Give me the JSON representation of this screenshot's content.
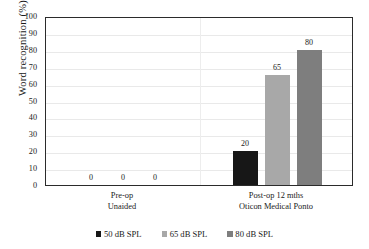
{
  "chart_data": {
    "type": "bar",
    "title": "",
    "xlabel": "",
    "ylabel": "Word recognition (%)",
    "ylim": [
      0,
      100
    ],
    "ytick_step": 10,
    "yticks": [
      "100",
      "90",
      "80",
      "70",
      "60",
      "50",
      "40",
      "30",
      "20",
      "10",
      "0"
    ],
    "grid": "horizontal",
    "legend_position": "bottom",
    "categories": [
      "Pre-op\nUnaided",
      "Post-op 12 mths\nOticon Medical Ponto"
    ],
    "category_lines": [
      [
        "Pre-op",
        "Unaided"
      ],
      [
        "Post-op 12 mths",
        "Oticon Medical Ponto"
      ]
    ],
    "series": [
      {
        "name": "50 dB SPL",
        "color": "#171717",
        "values": [
          0,
          20
        ]
      },
      {
        "name": "65 dB SPL",
        "color": "#a8a8a8",
        "values": [
          0,
          65
        ]
      },
      {
        "name": "80 dB SPL",
        "color": "#7e7e7e",
        "values": [
          0,
          80
        ]
      }
    ],
    "data_labels": [
      {
        "group": 0,
        "series": 0,
        "value": "0"
      },
      {
        "group": 0,
        "series": 1,
        "value": "0"
      },
      {
        "group": 0,
        "series": 2,
        "value": "0"
      },
      {
        "group": 1,
        "series": 0,
        "value": "20"
      },
      {
        "group": 1,
        "series": 1,
        "value": "65"
      },
      {
        "group": 1,
        "series": 2,
        "value": "80"
      }
    ]
  },
  "legend": {
    "items": [
      {
        "label": "50 dB SPL",
        "color": "#171717"
      },
      {
        "label": "65 dB SPL",
        "color": "#a8a8a8"
      },
      {
        "label": "80 dB SPL",
        "color": "#7e7e7e"
      }
    ]
  },
  "axes": {
    "y_title": "Word recognition (%)"
  }
}
